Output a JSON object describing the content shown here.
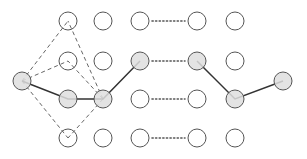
{
  "diagram": {
    "title": "",
    "node_radius": 9,
    "colors": {
      "stroke": "#555555",
      "gray_fill": "#dedede",
      "white_fill": "#ffffff",
      "solid_line": "#333333",
      "dashed_line": "#666666",
      "dotted_line": "#555555"
    },
    "columns_x": [
      68,
      103,
      140,
      197,
      235
    ],
    "rows_y": [
      21,
      61,
      99,
      138
    ],
    "endpoints": [
      {
        "id": "start",
        "x": 22,
        "y": 81,
        "highlighted": true
      },
      {
        "id": "end",
        "x": 283,
        "y": 81,
        "highlighted": true
      }
    ],
    "highlighted_cells": [
      [
        2,
        0
      ],
      [
        2,
        1
      ],
      [
        1,
        2
      ],
      [
        1,
        3
      ],
      [
        2,
        4
      ]
    ],
    "solid_paths": [
      [
        [
          22,
          81
        ],
        [
          68,
          99
        ],
        [
          103,
          99
        ],
        [
          140,
          61
        ]
      ],
      [
        [
          197,
          61
        ],
        [
          235,
          99
        ],
        [
          283,
          81
        ]
      ]
    ],
    "dashed_edges": [
      [
        [
          22,
          81
        ],
        [
          68,
          21
        ]
      ],
      [
        [
          22,
          81
        ],
        [
          68,
          61
        ]
      ],
      [
        [
          22,
          81
        ],
        [
          68,
          138
        ]
      ],
      [
        [
          103,
          99
        ],
        [
          68,
          21
        ]
      ],
      [
        [
          103,
          99
        ],
        [
          68,
          61
        ]
      ],
      [
        [
          103,
          99
        ],
        [
          68,
          138
        ]
      ]
    ],
    "ellipsis_between_columns": [
      2,
      3
    ],
    "ellipsis_rows": [
      0,
      1,
      2,
      3
    ]
  }
}
